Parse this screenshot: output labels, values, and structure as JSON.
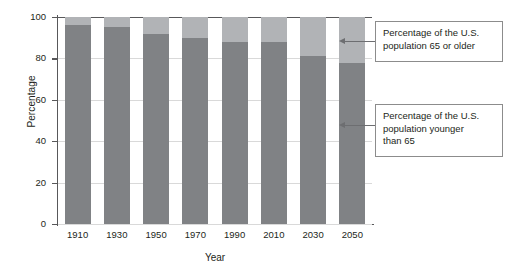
{
  "chart_data": {
    "type": "bar",
    "stacked": true,
    "title": "",
    "xlabel": "Year",
    "ylabel": "Percentage",
    "categories": [
      "1910",
      "1930",
      "1950",
      "1970",
      "1990",
      "2010",
      "2030",
      "2050"
    ],
    "series": [
      {
        "name": "Percentage of the U.S. population younger than 65",
        "color": "#808285",
        "values": [
          96,
          95,
          92,
          90,
          88,
          88,
          81,
          78
        ]
      },
      {
        "name": "Percentage of the U.S. population 65 or older",
        "color": "#b1b3b6",
        "values": [
          4,
          5,
          8,
          10,
          12,
          12,
          19,
          22
        ]
      }
    ],
    "ylim": [
      0,
      100
    ],
    "yticks": [
      0,
      20,
      40,
      60,
      80,
      100
    ],
    "ytick_labels": [
      "0",
      "20",
      "40",
      "60",
      "80",
      "100"
    ],
    "grid": true,
    "legend_position": "annotations-right"
  },
  "annotations": [
    {
      "id": "older",
      "text": "Percentage of the U.S. population 65 or older",
      "line1": "Percentage of the U.S.",
      "line2": "population 65 or older",
      "line3": ""
    },
    {
      "id": "younger",
      "text": "Percentage of the U.S. population younger than 65",
      "line1": "Percentage of the U.S.",
      "line2": "population younger",
      "line3": "than 65"
    }
  ],
  "colors": {
    "lower_segment": "#808285",
    "upper_segment": "#b1b3b6",
    "axis": "#58585a",
    "gridline": "#d9d9d9",
    "callout_border": "#8c8c8c",
    "leader": "#6d6e71",
    "text": "#231f20"
  }
}
